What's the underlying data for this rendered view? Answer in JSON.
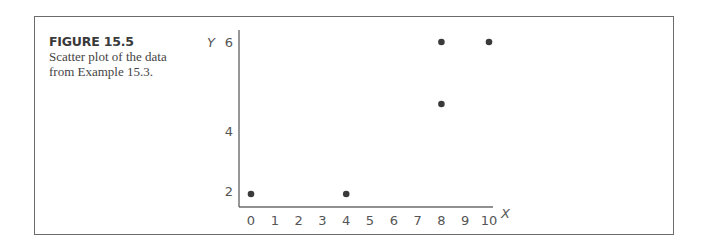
{
  "figure": {
    "label": "FIGURE 15.5",
    "caption_line1": "Scatter plot of the data",
    "caption_line2": "from Example 15.3."
  },
  "chart_data": {
    "type": "scatter",
    "title": "",
    "xlabel": "X",
    "ylabel": "Y",
    "xlim": [
      0,
      10
    ],
    "ylim": [
      0,
      6
    ],
    "x_ticks": [
      0,
      1,
      2,
      3,
      4,
      5,
      6,
      7,
      8,
      9,
      10
    ],
    "y_ticks": [
      2,
      4,
      6
    ],
    "grid": false,
    "legend": null,
    "series": [
      {
        "name": "data",
        "points": [
          {
            "x": 0,
            "y": 2
          },
          {
            "x": 4,
            "y": 2
          },
          {
            "x": 8,
            "y": 4
          },
          {
            "x": 8,
            "y": 6
          },
          {
            "x": 10,
            "y": 6
          }
        ],
        "color": "#3a3a3a"
      }
    ]
  },
  "colors": {
    "axis": "#6b6b6b",
    "frame": "#6b6b6b",
    "point": "#3a3a3a",
    "text": "#555555"
  }
}
